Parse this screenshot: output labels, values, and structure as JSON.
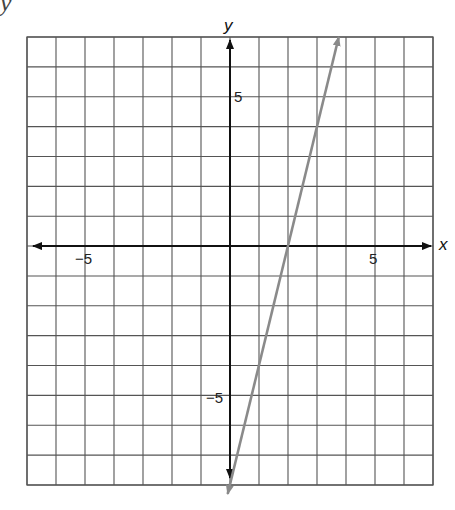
{
  "top_fragment": "            y",
  "chart_data": {
    "type": "line",
    "title": "",
    "xlabel": "x",
    "ylabel": "y",
    "xlim": [
      -7,
      7
    ],
    "ylim": [
      -8,
      7
    ],
    "grid": true,
    "x_ticks_labeled": [
      -5,
      5
    ],
    "y_ticks_labeled": [
      5,
      -5
    ],
    "tick_labels": {
      "x_neg": "−5",
      "x_pos": "5",
      "y_pos": "5",
      "y_neg": "−5"
    },
    "series": [
      {
        "name": "line",
        "equation": "y = 4x - 8",
        "slope": 4,
        "intercept": -8,
        "x": [
          -0.08,
          2,
          3.75
        ],
        "values": [
          -8.3,
          0,
          7
        ],
        "color": "#8a8a8a"
      }
    ]
  },
  "colors": {
    "grid": "#555555",
    "axis": "#111111",
    "line": "#8a8a8a"
  }
}
